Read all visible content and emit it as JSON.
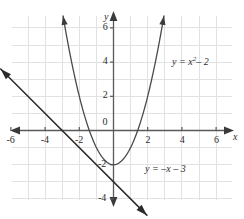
{
  "chart_data": {
    "type": "line",
    "title": "",
    "xlabel": "x",
    "ylabel": "y",
    "xlim": [
      -7,
      7
    ],
    "ylim": [
      -5.5,
      7
    ],
    "grid": true,
    "grid_step": 1,
    "legend_position": "inline-annotations",
    "xticks": [
      -6,
      -4,
      -2,
      0,
      2,
      4,
      6
    ],
    "xtick_labels": [
      "-6",
      "-4",
      "-2",
      "0",
      "2",
      "4",
      "6"
    ],
    "yticks": [
      -4,
      -2,
      2,
      4,
      6
    ],
    "ytick_labels": [
      "-4",
      "-2",
      "2",
      "4",
      "6"
    ],
    "origin_label": "0",
    "series": [
      {
        "name": "parabola",
        "equation_text": "y = x",
        "equation_exponent": "2",
        "equation_tail": "– 2",
        "formula": "y = x^2 - 2",
        "type": "quadratic",
        "a": 1,
        "b": 0,
        "c": -2,
        "vertex": [
          0,
          -2
        ],
        "x_intercepts": [
          -1.414,
          1.414
        ],
        "y_intercept": -2,
        "domain_drawn": [
          -2.95,
          2.95
        ],
        "color": "#4a4a4a",
        "arrows": "both-ends-up",
        "points": [
          [
            -2.95,
            6.7
          ],
          [
            -2.5,
            4.25
          ],
          [
            -2,
            2
          ],
          [
            -1.5,
            0.25
          ],
          [
            -1,
            -1
          ],
          [
            -0.5,
            -1.75
          ],
          [
            0,
            -2
          ],
          [
            0.5,
            -1.75
          ],
          [
            1,
            -1
          ],
          [
            1.5,
            0.25
          ],
          [
            2,
            2
          ],
          [
            2.5,
            4.25
          ],
          [
            2.95,
            6.7
          ]
        ]
      },
      {
        "name": "line",
        "equation_text": "y = –x – 3",
        "formula": "y = -x - 3",
        "type": "linear",
        "slope": -1,
        "intercept": -3,
        "x_intercept": -3,
        "y_intercept": -3,
        "domain_drawn": [
          -6.6,
          1.95
        ],
        "color": "#2b2b2b",
        "arrows": "both-ends",
        "points": [
          [
            -6.6,
            3.6
          ],
          [
            1.95,
            -4.95
          ]
        ]
      }
    ],
    "intersections": [
      [
        -1,
        -2
      ],
      [
        1,
        -4
      ]
    ],
    "annotations": [
      {
        "text": "y = x² – 2",
        "x": 3.15,
        "y": 4.45,
        "series": "parabola"
      },
      {
        "text": "y = –x – 3",
        "x": 1.75,
        "y": -3.5,
        "series": "line"
      }
    ],
    "colors": {
      "grid": "#e0e0e2",
      "axis": "#5a5a5a",
      "parabola": "#4a4a4a",
      "line": "#2b2b2b",
      "text": "#2b2b2b",
      "background": "#ffffff"
    }
  }
}
